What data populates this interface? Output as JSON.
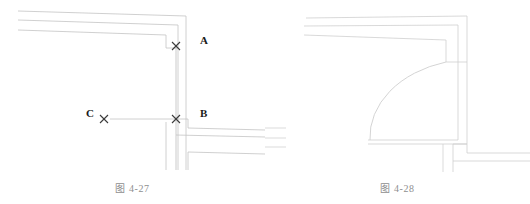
{
  "figures": [
    {
      "id": "figure-4-27",
      "caption": "图 4-27",
      "description": "CAD plan view of wall intersections before filleting, with snap markers at three pick points",
      "labels": [
        {
          "name": "A",
          "text": "A",
          "role": "first-wall-pick-point"
        },
        {
          "name": "B",
          "text": "B",
          "role": "second-wall-pick-point"
        },
        {
          "name": "C",
          "text": "C",
          "role": "reference-pick-point"
        }
      ],
      "markers": [
        {
          "name": "snap-marker-a",
          "glyph": "x",
          "x": 176,
          "y": 46
        },
        {
          "name": "snap-marker-b",
          "glyph": "x",
          "x": 176,
          "y": 119
        },
        {
          "name": "snap-marker-c",
          "glyph": "x",
          "x": 104,
          "y": 119
        }
      ]
    },
    {
      "id": "figure-4-28",
      "caption": "图 4-28",
      "description": "CAD plan view of the same corner after a quarter-circle fillet arc has been applied",
      "labels": [],
      "markers": []
    }
  ],
  "colors": {
    "line": "#c9c9c9",
    "line_dark": "#b4b4b4",
    "arc": "#cfcfcf",
    "marker": "#3a3a3a",
    "label_text": "#1a1a1a",
    "caption_text": "#8f8f8f",
    "background": "#ffffff"
  },
  "canvas": {
    "width": 530,
    "height": 204
  }
}
